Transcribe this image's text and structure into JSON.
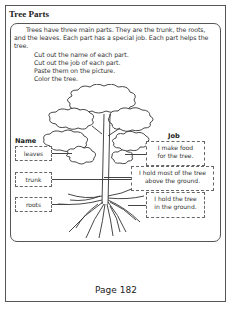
{
  "worksheet": {
    "title": "Tree Parts",
    "intro": "Trees have three main parts. They are the trunk, the roots, and the leaves. Each part has a special job. Each part helps the tree.",
    "steps": [
      "Cut out the name of each part.",
      "Cut out the job of each part.",
      "Paste them on the picture.",
      "Color the tree."
    ],
    "name_header": "Name",
    "job_header": "Job",
    "names": [
      "leaves",
      "trunk",
      "roots"
    ],
    "jobs": [
      {
        "line1": "I make food",
        "line2": "for the tree."
      },
      {
        "line1": "I hold most of the tree",
        "line2": "above the ground."
      },
      {
        "line1": "I hold the tree",
        "line2": "in the ground."
      }
    ],
    "illustration": "tree-drawing",
    "page_label": "Page 182"
  }
}
